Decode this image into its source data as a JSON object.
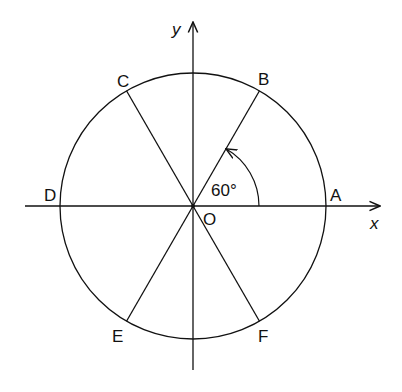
{
  "diagram": {
    "type": "unit circle divided into six 60-degree sectors",
    "axes": {
      "x_label": "x",
      "y_label": "y"
    },
    "origin_label": "O",
    "points": [
      {
        "name": "A",
        "angle_deg": 0
      },
      {
        "name": "B",
        "angle_deg": 60
      },
      {
        "name": "C",
        "angle_deg": 120
      },
      {
        "name": "D",
        "angle_deg": 180
      },
      {
        "name": "E",
        "angle_deg": 240
      },
      {
        "name": "F",
        "angle_deg": 300
      }
    ],
    "angle_annotation": "60°",
    "stroke_color": "#111111",
    "background": "#ffffff"
  }
}
